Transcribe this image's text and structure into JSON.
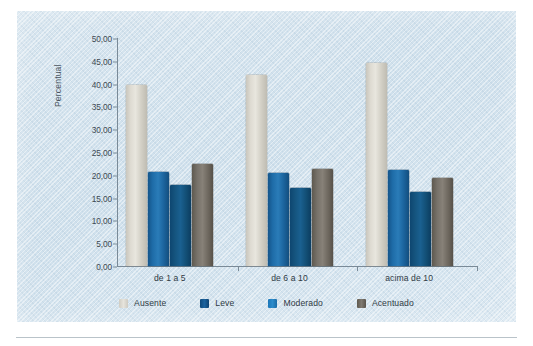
{
  "chart_data": {
    "type": "bar",
    "title": "",
    "xlabel": "",
    "ylabel": "Percentual",
    "ylim": [
      0,
      50
    ],
    "ytick_step": 5,
    "grid": false,
    "legend_position": "bottom",
    "decimal_separator": ",",
    "ytick_labels": [
      "50,00",
      "45,00",
      "40,00",
      "35,00",
      "30,00",
      "25,00",
      "20,00",
      "15,00",
      "10,00",
      "5,00",
      "0,00"
    ],
    "ytick_values": [
      50,
      45,
      40,
      35,
      30,
      25,
      20,
      15,
      10,
      5,
      0
    ],
    "categories": [
      "de 1 a 5",
      "de 6 a 10",
      "acima de 10"
    ],
    "series": [
      {
        "name": "Ausente",
        "color": "#dedbd2",
        "values": [
          39.7,
          41.8,
          44.5
        ]
      },
      {
        "name": "Leve",
        "color": "#1e6ca8",
        "values": [
          20.7,
          20.4,
          21.0
        ]
      },
      {
        "name": "Moderado",
        "color": "#15557f",
        "values": [
          17.7,
          17.0,
          16.3
        ]
      },
      {
        "name": "Acentuado",
        "color": "#77726a",
        "values": [
          22.3,
          21.3,
          19.3
        ]
      }
    ]
  },
  "legend": {
    "items": [
      {
        "label": "Ausente",
        "swatch": "ausente"
      },
      {
        "label": "Leve",
        "swatch": "leve"
      },
      {
        "label": "Moderado",
        "swatch": "moderado"
      },
      {
        "label": "Acentuado",
        "swatch": "acentuado"
      }
    ]
  },
  "axes": {
    "y_title": "Percentual"
  }
}
